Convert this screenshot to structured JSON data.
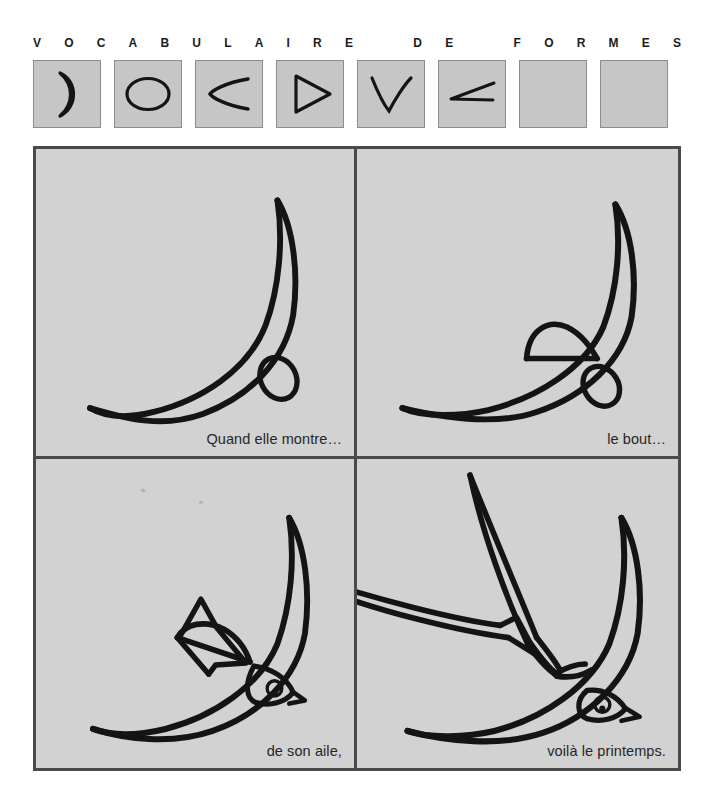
{
  "header": {
    "letters": [
      "V",
      "O",
      "C",
      "A",
      "B",
      "U",
      "L",
      "A",
      "I",
      "R",
      "E",
      "",
      "D",
      "E",
      "",
      "F",
      "O",
      "R",
      "M",
      "E",
      "S"
    ]
  },
  "shape_palette": {
    "label": "vocabulaire-de-formes-swatches",
    "swatch_fill": "#c6c6c6",
    "swatch_border": "#8c8c8c",
    "stroke_color": "#141414",
    "items": [
      {
        "name": "crescent-shape",
        "glyph": "crescent",
        "empty": false
      },
      {
        "name": "ellipse-shape",
        "glyph": "ellipse",
        "empty": false
      },
      {
        "name": "open-arc-left-shape",
        "glyph": "arc-left",
        "empty": false
      },
      {
        "name": "triangle-outline-shape",
        "glyph": "triangle",
        "empty": false
      },
      {
        "name": "v-stroke-shape",
        "glyph": "vee",
        "empty": false
      },
      {
        "name": "narrow-angle-shape",
        "glyph": "angle",
        "empty": false
      },
      {
        "name": "empty-swatch-7",
        "glyph": "",
        "empty": true
      },
      {
        "name": "empty-swatch-8",
        "glyph": "",
        "empty": true
      }
    ]
  },
  "comic": {
    "frame_border_color": "#4a4a4a",
    "panel_background": "#d2d2d2",
    "ink_color": "#141414",
    "panels": [
      {
        "name": "panel-step-1",
        "step": 1,
        "caption": "Quand elle montre…",
        "contents": [
          "crescent-wing",
          "small-ellipse-head"
        ]
      },
      {
        "name": "panel-step-2",
        "step": 2,
        "caption": "le bout…",
        "contents": [
          "crescent-wing",
          "small-ellipse-head",
          "upper-arc-wing"
        ]
      },
      {
        "name": "panel-step-3",
        "step": 3,
        "caption": "de son aile,",
        "contents": [
          "crescent-wing",
          "head-with-eye-and-beak",
          "upper-arc-wing",
          "triangle-tail"
        ]
      },
      {
        "name": "panel-step-4",
        "step": 4,
        "caption": "voilà le printemps.",
        "contents": [
          "crescent-wing",
          "head-with-eye-and-beak",
          "raised-wing",
          "forked-tail-streamers"
        ]
      }
    ]
  }
}
